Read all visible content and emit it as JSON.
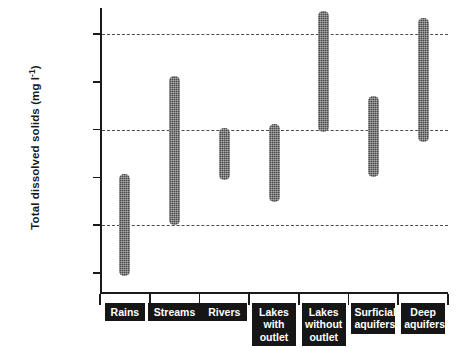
{
  "chart_data": {
    "type": "bar",
    "subtype": "range-bar",
    "title": "",
    "xlabel": "",
    "ylabel": "Total dissolved solids (mg l⁻¹)",
    "ylabel_text": "Total dissolved solids (mg l",
    "ylabel_sup": "-1",
    "ylabel_close": ")",
    "yscale": "log",
    "ylim": [
      0.6,
      400000
    ],
    "grid": "horizontal-dashed-at-10-1000-100000",
    "legend": "none",
    "ytick_labels": [
      "100,000",
      "10,000",
      "1,000",
      "100",
      "10",
      "1"
    ],
    "ytick_values": [
      100000,
      10000,
      1000,
      100,
      10,
      1
    ],
    "gridline_values": [
      100000,
      1000,
      10
    ],
    "categories": [
      "Rains",
      "Streams",
      "Rivers",
      "Lakes\nwith\noutlet",
      "Lakes\nwithout\noutlet",
      "Surficial\naquifers",
      "Deep\naquifers"
    ],
    "category_labels_plain": [
      "Rains",
      "Streams",
      "Rivers",
      "Lakes with outlet",
      "Lakes without outlet",
      "Surficial aquifers",
      "Deep aquifers"
    ],
    "series": [
      {
        "name": "Total dissolved solids range",
        "ranges": [
          {
            "category": "Rains",
            "low": 0.85,
            "high": 120
          },
          {
            "category": "Streams",
            "low": 10,
            "high": 13000
          },
          {
            "category": "Rivers",
            "low": 90,
            "high": 1100
          },
          {
            "category": "Lakes with outlet",
            "low": 30,
            "high": 1300
          },
          {
            "category": "Lakes without outlet",
            "low": 900,
            "high": 300000
          },
          {
            "category": "Surficial aquifers",
            "low": 100,
            "high": 5000
          },
          {
            "category": "Deep aquifers",
            "low": 560,
            "high": 220000
          }
        ]
      }
    ],
    "colors": {
      "bar": "#4a4a4a",
      "axis": "#1a1a1a",
      "grid": "#4d4d4d",
      "label_box_bg": "#161616",
      "label_box_text": "#ffffff",
      "background": "#ffffff"
    }
  }
}
